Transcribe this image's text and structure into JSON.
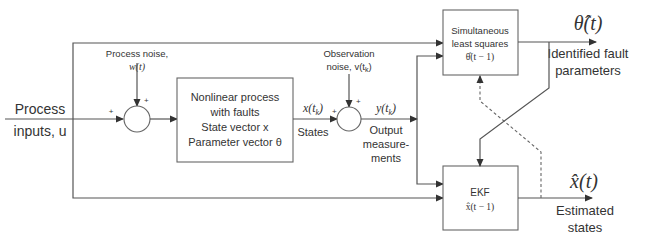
{
  "diagram": {
    "input": {
      "line1": "Process",
      "line2": "inputs, u"
    },
    "process_noise": {
      "line1": "Process noise,",
      "line2": "w(t)"
    },
    "observation_noise": {
      "line1": "Observation",
      "line2": "noise, v(t",
      "sub": "k",
      "close": ")"
    },
    "process_block": {
      "lines": [
        "Nonlinear process",
        "with faults",
        "State vector x",
        "Parameter vector θ"
      ]
    },
    "state_signal": {
      "symbol": "x(t",
      "sub": "k",
      "close": ")",
      "label": "States"
    },
    "output_signal": {
      "symbol": "y(t",
      "sub": "k",
      "close": ")",
      "label_lines": [
        "Output",
        "measure-",
        "ments"
      ]
    },
    "sls_block": {
      "lines": [
        "Simultaneous",
        "least squares",
        "θ̂(t − 1)"
      ]
    },
    "ekf_block": {
      "lines": [
        "EKF",
        "x̂(t − 1)"
      ]
    },
    "theta_output": {
      "symbol": "θ̂(t)",
      "label_lines": [
        "Identified fault",
        "parameters"
      ]
    },
    "x_output": {
      "symbol": "x̂(t)",
      "label_lines": [
        "Estimated",
        "states"
      ]
    },
    "plus_sign": "+"
  }
}
